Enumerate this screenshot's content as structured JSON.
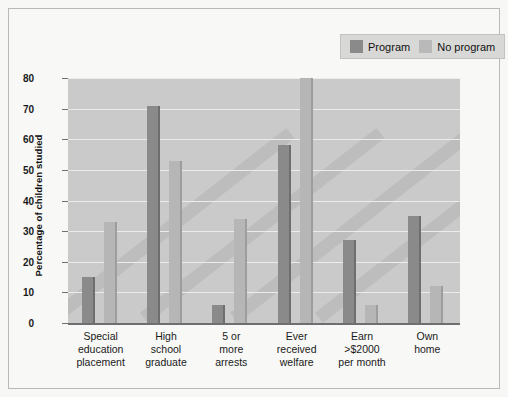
{
  "chart_data": {
    "type": "bar",
    "title": "",
    "xlabel": "",
    "ylabel": "Percentage of children studied",
    "ylim": [
      0,
      80
    ],
    "yticks": [
      0,
      10,
      20,
      30,
      40,
      50,
      60,
      70,
      80
    ],
    "grid": true,
    "legend_position": "top-right",
    "categories": [
      "Special education placement",
      "High school graduate",
      "5 or more arrests",
      "Ever received welfare",
      "Earn >$2000 per month",
      "Own home"
    ],
    "category_lines": [
      [
        "Special",
        "education",
        "placement"
      ],
      [
        "High",
        "school",
        "graduate"
      ],
      [
        "5 or",
        "more",
        "arrests"
      ],
      [
        "Ever",
        "received",
        "welfare"
      ],
      [
        "Earn",
        ">$2000",
        "per month"
      ],
      [
        "Own",
        "home"
      ]
    ],
    "series": [
      {
        "name": "Program",
        "color": "#8a8a8a",
        "values": [
          15,
          71,
          6,
          58,
          27,
          35
        ]
      },
      {
        "name": "No program",
        "color": "#b6b6b6",
        "values": [
          33,
          53,
          34,
          80,
          6,
          12
        ]
      }
    ]
  },
  "legend": {
    "items": [
      {
        "label": "Program"
      },
      {
        "label": "No program"
      }
    ]
  },
  "colors": {
    "plot_background": "#cacaca",
    "page_background": "#f7f7f5",
    "gridline": "#ececeb",
    "axis": "#6f6f6f"
  }
}
